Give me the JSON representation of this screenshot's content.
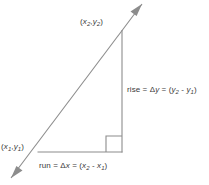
{
  "figure": {
    "background_color": "#ffffff",
    "stroke_color": "#8c8c8c",
    "text_color": "#3a3a3a",
    "labels": {
      "point_upper": {
        "full_text": "(x2,y2)",
        "open_paren": "(",
        "x_var": "x",
        "x_sub": "2",
        "comma": ",",
        "y_var": "y",
        "y_sub": "2",
        "close_paren": ")"
      },
      "point_lower": {
        "full_text": "(x1,y1)",
        "open_paren": "(",
        "x_var": "x",
        "x_sub": "1",
        "comma": ",",
        "y_var": "y",
        "y_sub": "1",
        "close_paren": ")"
      },
      "rise": {
        "full_text": "rise = Δy = (y2 - y1)",
        "word": "rise",
        "equals_1": " = ",
        "delta": "Δ",
        "delta_var": "y",
        "equals_2": " = ",
        "open_paren": "(",
        "term1_var": "y",
        "term1_sub": "2",
        "minus": " - ",
        "term2_var": "y",
        "term2_sub": "1",
        "close_paren": ")"
      },
      "run": {
        "full_text": "run = Δx = (x2 - x1)",
        "word": "run",
        "equals_1": " = ",
        "delta": "Δ",
        "delta_var": "x",
        "equals_2": " = ",
        "open_paren": "(",
        "term1_var": "x",
        "term1_sub": "2",
        "minus": " - ",
        "term2_var": "x",
        "term2_sub": "1",
        "close_paren": ")"
      }
    },
    "geometry": {
      "vertex_lower_left": [
        38,
        152
      ],
      "vertex_upper_right": [
        122,
        30
      ],
      "vertex_corner": [
        122,
        152
      ],
      "arrow_tip_upper": [
        142,
        4
      ],
      "arrow_tip_lower": [
        11,
        178
      ],
      "right_angle_marker": [
        106,
        136,
        16,
        16
      ]
    }
  }
}
